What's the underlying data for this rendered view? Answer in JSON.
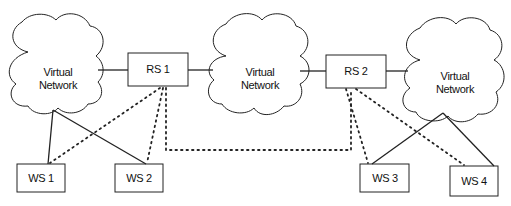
{
  "diagram": {
    "clouds": [
      {
        "id": "vn1",
        "line1": "Virtual",
        "line2": "Network"
      },
      {
        "id": "vn2",
        "line1": "Virtual",
        "line2": "Network"
      },
      {
        "id": "vn3",
        "line1": "Virtual",
        "line2": "Network"
      }
    ],
    "routers": [
      {
        "id": "rs1",
        "label": "RS 1"
      },
      {
        "id": "rs2",
        "label": "RS 2"
      }
    ],
    "workstations": [
      {
        "id": "ws1",
        "label": "WS 1"
      },
      {
        "id": "ws2",
        "label": "WS 2"
      },
      {
        "id": "ws3",
        "label": "WS 3"
      },
      {
        "id": "ws4",
        "label": "WS 4"
      }
    ],
    "connections": {
      "solid": [
        [
          "vn1",
          "rs1"
        ],
        [
          "rs1",
          "vn2"
        ],
        [
          "vn2",
          "rs2"
        ],
        [
          "rs2",
          "vn3"
        ],
        [
          "vn1",
          "ws1"
        ],
        [
          "vn1",
          "ws2"
        ],
        [
          "vn3",
          "ws3"
        ],
        [
          "vn3",
          "ws4"
        ]
      ],
      "dotted": [
        [
          "rs1",
          "ws1"
        ],
        [
          "rs1",
          "ws2"
        ],
        [
          "rs1",
          "rs2"
        ],
        [
          "rs2",
          "ws3"
        ],
        [
          "rs2",
          "ws4"
        ]
      ]
    },
    "colors": {
      "stroke": "#222222",
      "background": "#ffffff",
      "text": "#111111"
    }
  }
}
